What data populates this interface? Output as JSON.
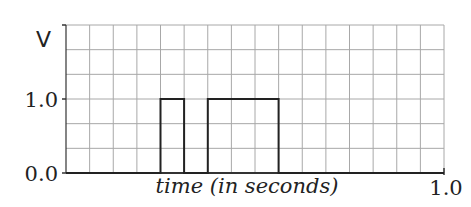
{
  "chart_data": {
    "type": "line",
    "title": "",
    "xlabel": "time (in seconds)",
    "ylabel": "V",
    "xlim": [
      0.0,
      1.0
    ],
    "ylim": [
      0.0,
      2.0
    ],
    "x_tick_labels": [
      "1.0"
    ],
    "y_tick_labels": [
      "0.0",
      "1.0"
    ],
    "grid": true,
    "grid_columns": 16,
    "grid_rows": 6,
    "legend": null,
    "series": [
      {
        "name": "voltage",
        "step": true,
        "x": [
          0.0,
          0.25,
          0.25,
          0.3125,
          0.3125,
          0.375,
          0.375,
          0.5625,
          0.5625,
          1.0
        ],
        "y": [
          0.0,
          0.0,
          1.0,
          1.0,
          0.0,
          0.0,
          1.0,
          1.0,
          0.0,
          0.0
        ]
      }
    ],
    "pulses": [
      {
        "start": 0.25,
        "end": 0.3125,
        "level": 1.0
      },
      {
        "start": 0.375,
        "end": 0.5625,
        "level": 1.0
      }
    ]
  },
  "labels": {
    "y_axis": "V",
    "y_tick_high": "1.0",
    "y_tick_low": "0.0",
    "x_axis": "time (in seconds)",
    "x_tick_end": "1.0"
  },
  "colors": {
    "grid": "#a8a8a8",
    "axis": "#333333",
    "signal": "#222222"
  }
}
